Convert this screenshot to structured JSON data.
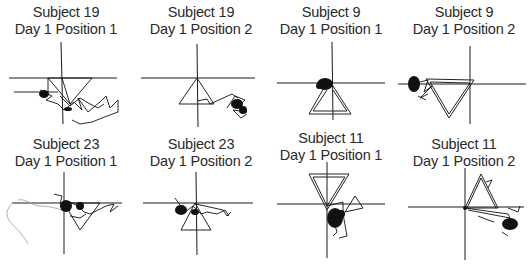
{
  "figure": {
    "layout": {
      "rows": 2,
      "columns": 4
    },
    "panels": [
      {
        "id": "s19-p1",
        "subject": "Subject 19",
        "condition": "Day 1 Position 1"
      },
      {
        "id": "s19-p2",
        "subject": "Subject 19",
        "condition": "Day 1 Position 2"
      },
      {
        "id": "s9-p1",
        "subject": "Subject 9",
        "condition": "Day 1 Position 1"
      },
      {
        "id": "s9-p2",
        "subject": "Subject 9",
        "condition": "Day 1 Position 2"
      },
      {
        "id": "s23-p1",
        "subject": "Subject 23",
        "condition": "Day 1 Position 1"
      },
      {
        "id": "s23-p2",
        "subject": "Subject 23",
        "condition": "Day 1 Position 2"
      },
      {
        "id": "s11-p1",
        "subject": "Subject 11",
        "condition": "Day 1 Position 1"
      },
      {
        "id": "s11-p2",
        "subject": "Subject 11",
        "condition": "Day 1 Position 2"
      }
    ],
    "colors": {
      "line": "#111111",
      "background": "#ffffff",
      "faint_trace": "#9a9a9a"
    }
  }
}
